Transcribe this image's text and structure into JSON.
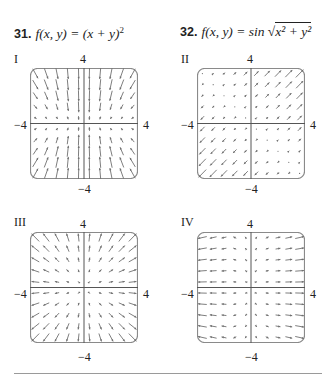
{
  "problems": [
    {
      "number": "31.",
      "lhs": "f(x, y) = ",
      "rhs": "(x + y)",
      "sup": "2"
    },
    {
      "number": "32.",
      "lhs": "f(x, y) = sin ",
      "radicand": "x² + y²"
    }
  ],
  "panels": [
    {
      "id": "I",
      "label": "I",
      "top": "4",
      "bottom": "−4",
      "left": "−4",
      "right": "4",
      "field": "I"
    },
    {
      "id": "II",
      "label": "II",
      "top": "4",
      "bottom": "−4",
      "left": "−4",
      "right": "4",
      "field": "II"
    },
    {
      "id": "III",
      "label": "III",
      "top": "4",
      "bottom": "−4",
      "left": "−4",
      "right": "4",
      "field": "III"
    },
    {
      "id": "IV",
      "label": "IV",
      "top": "4",
      "bottom": "−4",
      "left": "−4",
      "right": "4",
      "field": "IV"
    }
  ],
  "chart_data": [
    {
      "type": "vector_field",
      "title": "I",
      "xlim": [
        -4,
        4
      ],
      "ylim": [
        -4,
        4
      ],
      "grid": "10x10 arrows",
      "description": "arrows point inward toward origin along y-direction, converging toward center; long near the vertical axis"
    },
    {
      "type": "vector_field",
      "title": "II",
      "xlim": [
        -4,
        4
      ],
      "ylim": [
        -4,
        4
      ],
      "grid": "10x10 arrows",
      "description": "arrows along (1,1) direction; large in quadrant I pointing up-right and quadrant III pointing down-left; tiny in quadrants II and IV"
    },
    {
      "type": "vector_field",
      "title": "III",
      "xlim": [
        -4,
        4
      ],
      "ylim": [
        -4,
        4
      ],
      "grid": "10x10 arrows",
      "description": "radial outward arrows, magnitude growing with distance from origin"
    },
    {
      "type": "vector_field",
      "title": "IV",
      "xlim": [
        -4,
        4
      ],
      "ylim": [
        -4,
        4
      ],
      "grid": "10x10 arrows",
      "description": "arrows mostly horizontal; right side points right, left side points left, magnitude grows with |x|"
    }
  ],
  "colors": {
    "arrow": "#6f6f6f",
    "axis": "#555555",
    "frame": "#8a8a8a",
    "divider": "#9a9a9a"
  }
}
